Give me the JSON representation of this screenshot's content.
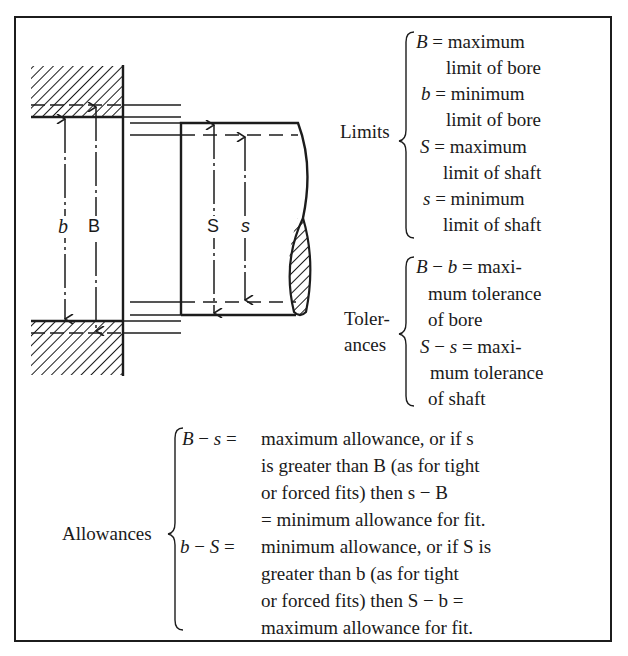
{
  "figure": {
    "diagram_labels": {
      "bore_min": "b",
      "bore_max": "B",
      "shaft_max": "S",
      "shaft_min": "s"
    },
    "limits": {
      "label": "Limits",
      "entries": [
        {
          "symbol": "B",
          "eq": "= maximum",
          "cont": "limit of bore"
        },
        {
          "symbol": "b",
          "eq": "= minimum",
          "cont": "limit of bore"
        },
        {
          "symbol": "S",
          "eq": "= maximum",
          "cont": "limit of shaft"
        },
        {
          "symbol": "s",
          "eq": "= minimum",
          "cont": "limit of shaft"
        }
      ]
    },
    "tolerances": {
      "label_line1": "Toler-",
      "label_line2": "ances",
      "entries": [
        {
          "lhs_a": "B",
          "op": "−",
          "lhs_b": "b",
          "eq": "= maxi-",
          "cont1": "mum tolerance",
          "cont2": "of bore"
        },
        {
          "lhs_a": "S",
          "op": "−",
          "lhs_b": "s",
          "eq": "= maxi-",
          "cont1": "mum tolerance",
          "cont2": "of shaft"
        }
      ]
    },
    "allowances": {
      "label": "Allowances",
      "entries": [
        {
          "lhs_a": "B",
          "op": "−",
          "lhs_b": "s",
          "eq": "=",
          "lines": [
            [
              "maximum allowance, or if ",
              {
                "v": "s"
              },
              ""
            ],
            [
              "is greater than ",
              {
                "v": "B"
              },
              " (as for tight"
            ],
            [
              "or forced fits) then ",
              {
                "v": "s − B"
              },
              ""
            ],
            [
              "= minimum allowance for fit.",
              null,
              ""
            ]
          ],
          "line_text": [
            "maximum allowance, or if s",
            "is greater than B (as for tight",
            "or forced fits) then s − B",
            "= minimum allowance for fit."
          ]
        },
        {
          "lhs_a": "b",
          "op": "−",
          "lhs_b": "S",
          "eq": "=",
          "line_text": [
            "minimum allowance, or if S is",
            "greater than b (as for tight",
            "or forced fits) then S − b =",
            "maximum allowance for fit."
          ]
        }
      ]
    },
    "colors": {
      "ink": "#1c1c1c",
      "paper": "#ffffff"
    }
  }
}
